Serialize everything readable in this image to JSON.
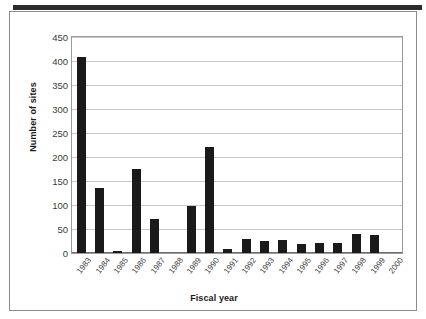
{
  "chart_data": {
    "type": "bar",
    "title": "",
    "xlabel": "Fiscal year",
    "ylabel": "Number of sites",
    "categories": [
      "1983",
      "1984",
      "1985",
      "1986",
      "1987",
      "1988",
      "1989",
      "1990",
      "1991",
      "1992",
      "1993",
      "1994",
      "1995",
      "1996",
      "1997",
      "1998",
      "1999",
      "2000"
    ],
    "values": [
      408,
      135,
      5,
      175,
      70,
      0,
      97,
      220,
      8,
      30,
      25,
      28,
      18,
      20,
      20,
      40,
      38,
      0
    ],
    "series": [
      {
        "name": "Number of sites",
        "values": [
          408,
          135,
          5,
          175,
          70,
          0,
          97,
          220,
          8,
          30,
          25,
          28,
          18,
          20,
          20,
          40,
          38,
          0
        ]
      }
    ],
    "ylim": [
      0,
      450
    ],
    "yticks": [
      0,
      50,
      100,
      150,
      200,
      250,
      300,
      350,
      400,
      450
    ],
    "ytick_labels": [
      "0",
      "50",
      "100",
      "150",
      "200",
      "250",
      "300",
      "350",
      "400",
      "450"
    ],
    "grid": "horizontal",
    "legend": "none",
    "bar_color": "#1a1a1a",
    "plot_background": "#ffffff",
    "gridline_color": "#c9c9c9",
    "axis_color": "#6e6e6e",
    "xtick_rotation": -52
  }
}
